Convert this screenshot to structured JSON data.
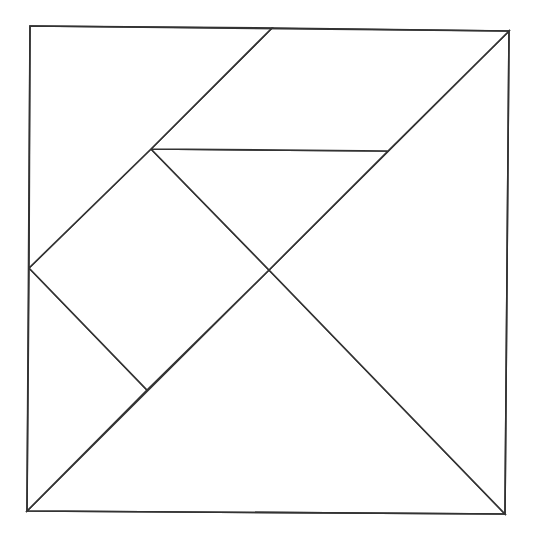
{
  "diagram": {
    "type": "tangram",
    "background": "#ffffff",
    "line_color": "#333333",
    "outer_square": [
      [
        30,
        26
      ],
      [
        509,
        31
      ],
      [
        505,
        514
      ],
      [
        27,
        511
      ]
    ],
    "pieces": [
      {
        "name": "large-triangle-bottom",
        "points": [
          [
            27,
            511
          ],
          [
            505,
            514
          ],
          [
            269,
            270
          ]
        ]
      },
      {
        "name": "large-triangle-right",
        "points": [
          [
            509,
            31
          ],
          [
            505,
            514
          ],
          [
            269,
            270
          ]
        ]
      },
      {
        "name": "medium-triangle-bottom-left",
        "points": [
          [
            29,
            268
          ],
          [
            147,
            390
          ],
          [
            27,
            511
          ]
        ]
      },
      {
        "name": "square",
        "points": [
          [
            151,
            149
          ],
          [
            269,
            270
          ],
          [
            147,
            390
          ],
          [
            29,
            268
          ]
        ]
      },
      {
        "name": "small-triangle-middle",
        "points": [
          [
            151,
            149
          ],
          [
            388,
            151
          ],
          [
            269,
            270
          ]
        ]
      },
      {
        "name": "parallelogram",
        "points": [
          [
            272,
            28
          ],
          [
            509,
            31
          ],
          [
            388,
            151
          ],
          [
            151,
            149
          ]
        ]
      },
      {
        "name": "small-triangle-top-left",
        "points": [
          [
            30,
            26
          ],
          [
            272,
            28
          ],
          [
            151,
            149
          ],
          [
            29,
            268
          ]
        ]
      }
    ]
  }
}
